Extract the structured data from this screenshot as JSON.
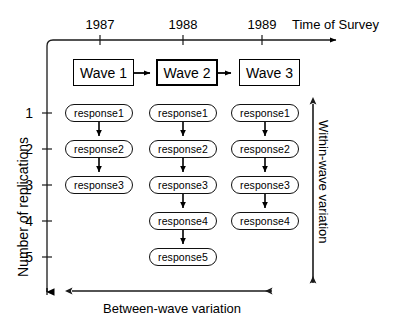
{
  "figure": {
    "timeline": {
      "axis_title": "Time of Survey",
      "years": [
        "1987",
        "1988",
        "1989"
      ]
    },
    "waves": [
      {
        "label": "Wave 1",
        "emphasis": false
      },
      {
        "label": "Wave 2",
        "emphasis": true
      },
      {
        "label": "Wave 3",
        "emphasis": false
      }
    ],
    "wave_flow_arrows": [
      "wave1-to-wave2",
      "wave2-to-wave3"
    ],
    "replication_axis": {
      "label": "Number of replications",
      "ticks": [
        "1",
        "2",
        "3",
        "4",
        "5"
      ]
    },
    "columns": [
      {
        "wave": "Wave 1",
        "responses": [
          "response1",
          "response2",
          "response3"
        ]
      },
      {
        "wave": "Wave 2",
        "responses": [
          "response1",
          "response2",
          "response3",
          "response4",
          "response5"
        ]
      },
      {
        "wave": "Wave 3",
        "responses": [
          "response1",
          "response2",
          "response3",
          "response4"
        ]
      }
    ],
    "annotations": {
      "within_wave": "Within-wave variation",
      "between_wave": "Between-wave variation"
    },
    "colors": {
      "ink": "#000000",
      "background": "#ffffff",
      "capsule_stroke": "#111111"
    }
  }
}
